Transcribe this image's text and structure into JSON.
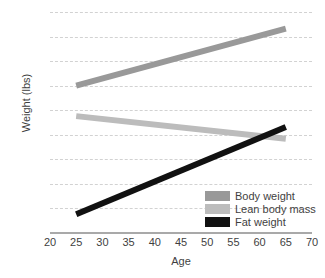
{
  "chart_data": {
    "type": "line",
    "title": "",
    "xlabel": "Age",
    "ylabel": "Weight (lbs)",
    "xlim": [
      20,
      70
    ],
    "ylim": [
      0,
      225
    ],
    "xticks": [
      20,
      25,
      30,
      35,
      40,
      45,
      50,
      55,
      60,
      65,
      70
    ],
    "yticks": [
      0,
      25,
      50,
      75,
      100,
      125,
      150,
      175,
      200,
      225
    ],
    "grid": "horizontal-dashed",
    "legend_position": "bottom-right-inside",
    "x": [
      25,
      65
    ],
    "series": [
      {
        "name": "Body weight",
        "color": "#999999",
        "values": [
          150,
          208
        ]
      },
      {
        "name": "Lean body mass",
        "color": "#bcbcbc",
        "values": [
          119,
          96
        ]
      },
      {
        "name": "Fat weight",
        "color": "#111111",
        "values": [
          19,
          108
        ]
      }
    ]
  },
  "axes": {
    "y_title": "Weight (lbs)",
    "x_title": "Age",
    "y_tick_labels": [
      "225",
      "200",
      "175",
      "150",
      "125",
      "100",
      "75",
      "50",
      "25",
      "0"
    ],
    "x_tick_labels": [
      "20",
      "25",
      "30",
      "35",
      "40",
      "45",
      "50",
      "55",
      "60",
      "65",
      "70"
    ]
  },
  "legend": {
    "items": [
      {
        "label": "Body weight",
        "color": "#999999"
      },
      {
        "label": "Lean body mass",
        "color": "#bcbcbc"
      },
      {
        "label": "Fat weight",
        "color": "#111111"
      }
    ]
  },
  "colors": {
    "body_weight": "#999999",
    "lean_body_mass": "#bcbcbc",
    "fat_weight": "#111111",
    "gridline": "#d2d2d2",
    "axis": "#a9a9a9",
    "text": "#3f3f3f",
    "background": "#ffffff"
  }
}
